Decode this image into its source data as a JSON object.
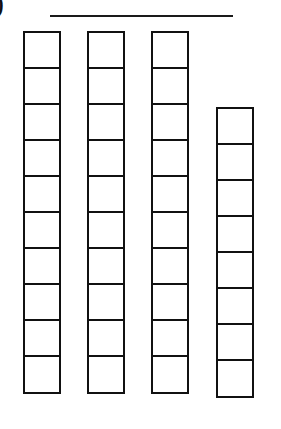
{
  "label": {
    "text": ")"
  },
  "answer_line": {
    "value": ""
  },
  "colors": {
    "stroke": "#111111",
    "background": "#ffffff"
  },
  "columns": [
    {
      "id": "tens-rod-1",
      "cells": 10,
      "left": 23,
      "top": 31
    },
    {
      "id": "tens-rod-2",
      "cells": 10,
      "left": 87,
      "top": 31
    },
    {
      "id": "tens-rod-3",
      "cells": 10,
      "left": 151,
      "top": 31
    },
    {
      "id": "partial-rod",
      "cells": 8,
      "left": 216,
      "top": 107
    }
  ],
  "total_cells": 38
}
